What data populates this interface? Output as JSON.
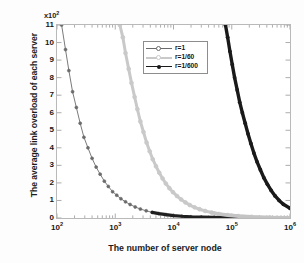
{
  "chart_data": {
    "type": "line",
    "title": "",
    "xlabel": "The number of server node",
    "ylabel": "The average link overload of each server",
    "y_multiplier": "x10",
    "y_multiplier_exponent": "2",
    "xscale": "log",
    "yscale": "linear",
    "xlim": [
      100,
      1000000
    ],
    "ylim": [
      0,
      11
    ],
    "grid": false,
    "legend_position": "upper center",
    "x_tick_labels": [
      "10",
      "10",
      "10",
      "10",
      "10"
    ],
    "x_tick_exponents": [
      "2",
      "3",
      "4",
      "5",
      "6"
    ],
    "x_tick_values": [
      100,
      1000,
      10000,
      100000,
      1000000
    ],
    "y_tick_labels": [
      "0",
      "1",
      "2",
      "3",
      "4",
      "5",
      "6",
      "7",
      "8",
      "9",
      "10",
      "11"
    ],
    "y_tick_values": [
      0,
      1,
      2,
      3,
      4,
      5,
      6,
      7,
      8,
      9,
      10,
      11
    ],
    "series": [
      {
        "name": "r=1",
        "color": "#6b6b6b",
        "marker": "circle",
        "linewidth": 0.9,
        "x": [
          120,
          140,
          160,
          185,
          215,
          250,
          290,
          340,
          400,
          470,
          550,
          650,
          760,
          900,
          1060,
          1250,
          1500,
          1800,
          2200,
          2700,
          3400,
          4300,
          5600,
          7500,
          10000,
          14000,
          20000,
          30000,
          50000,
          100000,
          300000,
          1000000
        ],
        "y": [
          11.0,
          9.6,
          8.4,
          7.2,
          6.3,
          5.4,
          4.6,
          4.0,
          3.4,
          2.9,
          2.5,
          2.1,
          1.8,
          1.5,
          1.3,
          1.1,
          0.92,
          0.77,
          0.63,
          0.51,
          0.41,
          0.32,
          0.25,
          0.19,
          0.14,
          0.1,
          0.07,
          0.05,
          0.03,
          0.015,
          0.005,
          0.002
        ]
      },
      {
        "name": "r=1/60",
        "color": "#c9c9c9",
        "marker": "circle",
        "linewidth": 3.0,
        "x": [
          1200,
          1350,
          1500,
          1700,
          1900,
          2150,
          2400,
          2700,
          3050,
          3450,
          3900,
          4400,
          5000,
          5700,
          6500,
          7400,
          8500,
          9800,
          11500,
          13500,
          16000,
          19000,
          23000,
          28000,
          35000,
          45000,
          60000,
          85000,
          130000,
          220000,
          450000,
          1000000
        ],
        "y": [
          11.0,
          10.3,
          9.4,
          8.5,
          7.7,
          6.9,
          6.2,
          5.5,
          4.9,
          4.3,
          3.8,
          3.35,
          2.95,
          2.58,
          2.25,
          1.96,
          1.7,
          1.47,
          1.25,
          1.06,
          0.89,
          0.74,
          0.61,
          0.5,
          0.4,
          0.31,
          0.23,
          0.165,
          0.108,
          0.064,
          0.031,
          0.014
        ]
      },
      {
        "name": "r=1/600",
        "color": "#1a1a1a",
        "marker": "star",
        "linewidth": 3.4,
        "x": [
          78000,
          85000,
          93000,
          102000,
          112000,
          124000,
          137000,
          152000,
          170000,
          190000,
          213000,
          240000,
          272000,
          310000,
          355000,
          410000,
          475000,
          555000,
          650000,
          770000,
          1000000
        ],
        "y": [
          11.0,
          10.3,
          9.5,
          8.75,
          8.0,
          7.3,
          6.6,
          6.0,
          5.4,
          4.8,
          4.25,
          3.7,
          3.2,
          2.75,
          2.3,
          1.92,
          1.57,
          1.26,
          1.0,
          0.78,
          0.55
        ]
      }
    ]
  },
  "legend": {
    "items": [
      {
        "label": "r=1",
        "color": "#6b6b6b"
      },
      {
        "label": "r=1/60",
        "color": "#c9c9c9"
      },
      {
        "label": "r=1/600",
        "color": "#1a1a1a"
      }
    ]
  }
}
